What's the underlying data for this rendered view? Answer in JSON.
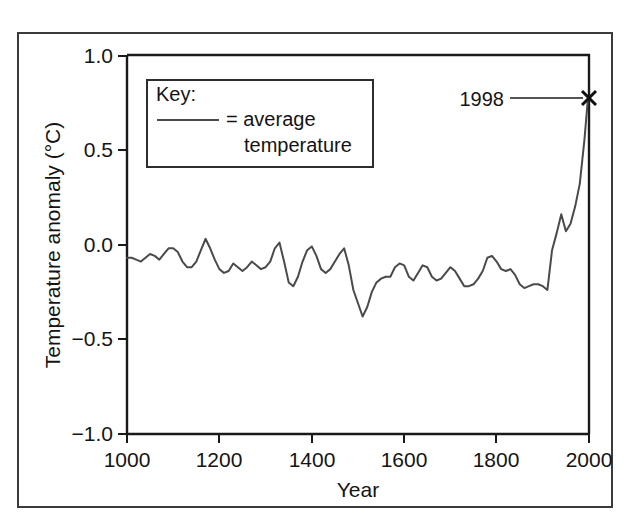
{
  "figure": {
    "caption_remnant": "",
    "background": "#ffffff",
    "frame_color": "#3b3b3b"
  },
  "legend": {
    "title": "Key:",
    "swatch_label_line1": "= average",
    "swatch_label_line2": "temperature",
    "swatch_color": "#4a4a4a"
  },
  "annotation": {
    "label": "1998",
    "marker": "x-marker"
  },
  "chart_data": {
    "type": "line",
    "title": "",
    "xlabel": "Year",
    "ylabel": "Temperature anomaly (°C)",
    "xlim": [
      1000,
      2000
    ],
    "ylim": [
      -1.0,
      1.0
    ],
    "xticks": [
      1000,
      1200,
      1400,
      1600,
      1800,
      2000
    ],
    "xtick_labels": [
      "1000",
      "1200",
      "1400",
      "1600",
      "1800",
      "2000"
    ],
    "yticks": [
      -1.0,
      -0.5,
      0.0,
      0.5,
      1.0
    ],
    "ytick_labels": [
      "−1.0",
      "−0.5",
      "0.0",
      "0.5",
      "1.0"
    ],
    "grid": false,
    "legend_position": "upper-left-inside",
    "series": [
      {
        "name": "average temperature",
        "color": "#4a4a4a",
        "x": [
          1000,
          1010,
          1020,
          1030,
          1040,
          1050,
          1060,
          1070,
          1080,
          1090,
          1100,
          1110,
          1120,
          1130,
          1140,
          1150,
          1160,
          1170,
          1180,
          1190,
          1200,
          1210,
          1220,
          1230,
          1240,
          1250,
          1260,
          1270,
          1280,
          1290,
          1300,
          1310,
          1320,
          1330,
          1340,
          1350,
          1360,
          1370,
          1380,
          1390,
          1400,
          1410,
          1420,
          1430,
          1440,
          1450,
          1460,
          1470,
          1480,
          1490,
          1500,
          1510,
          1520,
          1530,
          1540,
          1550,
          1560,
          1570,
          1580,
          1590,
          1600,
          1610,
          1620,
          1630,
          1640,
          1650,
          1660,
          1670,
          1680,
          1690,
          1700,
          1710,
          1720,
          1730,
          1740,
          1750,
          1760,
          1770,
          1780,
          1790,
          1800,
          1810,
          1820,
          1830,
          1840,
          1850,
          1860,
          1870,
          1880,
          1890,
          1900,
          1910,
          1920,
          1930,
          1940,
          1950,
          1960,
          1970,
          1980,
          1990,
          1998
        ],
        "y": [
          -0.07,
          -0.07,
          -0.08,
          -0.09,
          -0.07,
          -0.05,
          -0.06,
          -0.08,
          -0.05,
          -0.02,
          -0.02,
          -0.04,
          -0.09,
          -0.12,
          -0.12,
          -0.09,
          -0.03,
          0.03,
          -0.02,
          -0.08,
          -0.13,
          -0.15,
          -0.14,
          -0.1,
          -0.12,
          -0.14,
          -0.12,
          -0.09,
          -0.11,
          -0.13,
          -0.12,
          -0.09,
          -0.02,
          0.01,
          -0.09,
          -0.2,
          -0.22,
          -0.17,
          -0.09,
          -0.03,
          -0.01,
          -0.06,
          -0.13,
          -0.15,
          -0.13,
          -0.09,
          -0.05,
          -0.02,
          -0.11,
          -0.24,
          -0.31,
          -0.38,
          -0.33,
          -0.25,
          -0.2,
          -0.18,
          -0.17,
          -0.17,
          -0.12,
          -0.1,
          -0.11,
          -0.17,
          -0.19,
          -0.15,
          -0.11,
          -0.12,
          -0.17,
          -0.19,
          -0.18,
          -0.15,
          -0.12,
          -0.14,
          -0.18,
          -0.22,
          -0.22,
          -0.21,
          -0.18,
          -0.14,
          -0.07,
          -0.06,
          -0.09,
          -0.13,
          -0.14,
          -0.13,
          -0.16,
          -0.21,
          -0.23,
          -0.22,
          -0.21,
          -0.21,
          -0.22,
          -0.24,
          -0.03,
          0.06,
          0.16,
          0.07,
          0.11,
          0.2,
          0.32,
          0.55,
          0.78
        ]
      }
    ]
  }
}
